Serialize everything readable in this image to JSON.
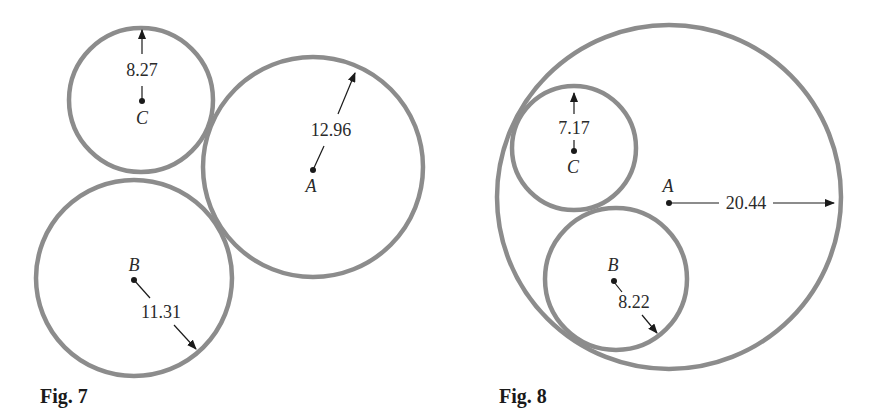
{
  "figures": [
    {
      "caption": "Fig. 7",
      "description": "Three mutually tangent circles (externally tangent)",
      "circles": [
        {
          "name": "A",
          "radius_label": "12.96",
          "radius": 12.96
        },
        {
          "name": "B",
          "radius_label": "11.31",
          "radius": 11.31
        },
        {
          "name": "C",
          "radius_label": "8.27",
          "radius": 8.27
        }
      ]
    },
    {
      "caption": "Fig. 8",
      "description": "Two circles B and C internally tangent to large circle A and tangent to each other",
      "circles": [
        {
          "name": "A",
          "radius_label": "20.44",
          "radius": 20.44
        },
        {
          "name": "B",
          "radius_label": "8.22",
          "radius": 8.22
        },
        {
          "name": "C",
          "radius_label": "7.17",
          "radius": 7.17
        }
      ]
    }
  ],
  "colors": {
    "circle_stroke": "#8c8c8c",
    "ink": "#1a1a1a"
  }
}
